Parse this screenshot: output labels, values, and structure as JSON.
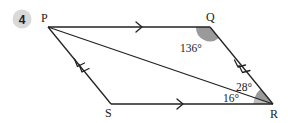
{
  "question": {
    "number": "4",
    "badge_color": "#d9d9d9"
  },
  "figure": {
    "type": "parallelogram",
    "vertices": {
      "P": {
        "label": "P",
        "x": 48,
        "y": 27
      },
      "Q": {
        "label": "Q",
        "x": 210,
        "y": 27
      },
      "R": {
        "label": "R",
        "x": 273,
        "y": 104
      },
      "S": {
        "label": "S",
        "x": 111,
        "y": 104
      }
    },
    "segments": [
      "PQ",
      "QR",
      "RS",
      "SP",
      "PR"
    ],
    "parallel_marks": {
      "PQ_SR": "single arrow",
      "PS_QR": "double arrow"
    },
    "angles": {
      "Q": {
        "value": "136°",
        "shaded_color": "#9a9a9a"
      },
      "PRQ": {
        "value": "28°",
        "shaded_color": "#9a9a9a"
      },
      "PRS": {
        "value": "16°",
        "shaded_color": "#bdbdbd"
      }
    },
    "line_color": "#222222"
  }
}
